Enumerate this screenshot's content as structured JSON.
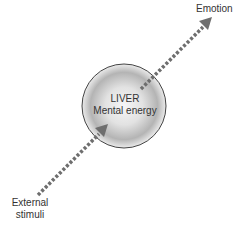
{
  "diagram": {
    "center_node": {
      "title": "LIVER",
      "subtitle": "Mental energy"
    },
    "input_label": "External stimuli",
    "input_line1": "External",
    "input_line2": "stimuli",
    "output_label": "Emotion",
    "colors": {
      "arrow": "#6e6e6e",
      "circle_border": "#444444",
      "circle_fill_center": "#f4f4f4",
      "circle_fill_edge": "#9a9a9a",
      "text": "#333333"
    }
  }
}
